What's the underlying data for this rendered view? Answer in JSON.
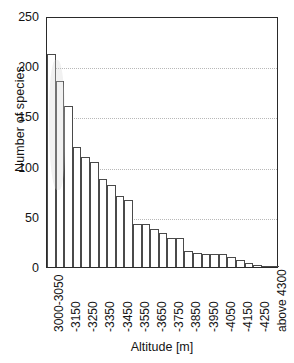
{
  "chart_data": {
    "type": "bar",
    "title": "",
    "xlabel": "Altitude [m]",
    "ylabel": "Number of species",
    "ylim": [
      0,
      250
    ],
    "yticks": [
      0,
      50,
      100,
      150,
      200,
      250
    ],
    "grid": "horizontal-dotted",
    "legend": "none",
    "bar_style": "white fill, dark outline, contiguous histogram",
    "categories": [
      "3000-3050",
      "-3100",
      "-3150",
      "-3200",
      "-3250",
      "-3300",
      "-3350",
      "-3400",
      "-3450",
      "-3500",
      "-3550",
      "-3600",
      "-3650",
      "-3700",
      "-3750",
      "-3800",
      "-3850",
      "-3900",
      "-3950",
      "-4000",
      "-4050",
      "-4100",
      "-4150",
      "-4200",
      "-4250",
      "-4300",
      "above 4300"
    ],
    "values": [
      212,
      185,
      160,
      120,
      110,
      105,
      88,
      82,
      71,
      67,
      43,
      43,
      38,
      34,
      29,
      29,
      16,
      14,
      13,
      13,
      13,
      10,
      7,
      4,
      2,
      1,
      1
    ],
    "visible_xtick_labels": [
      "3000-3050",
      "-3150",
      "-3250",
      "-3350",
      "-3450",
      "-3550",
      "-3650",
      "-3750",
      "-3850",
      "-3950",
      "-4050",
      "-4150",
      "-4250",
      "above 4300"
    ],
    "visible_xtick_bar_index": [
      0,
      2,
      4,
      6,
      8,
      10,
      12,
      14,
      16,
      18,
      20,
      22,
      24,
      26
    ],
    "colors": {
      "axis": "#2a2a2a",
      "bar_outline": "#4a4a4a",
      "bar_fill": "#ffffff",
      "grid": "#b8b8b8",
      "text": "#141414",
      "background": "#ffffff"
    }
  }
}
